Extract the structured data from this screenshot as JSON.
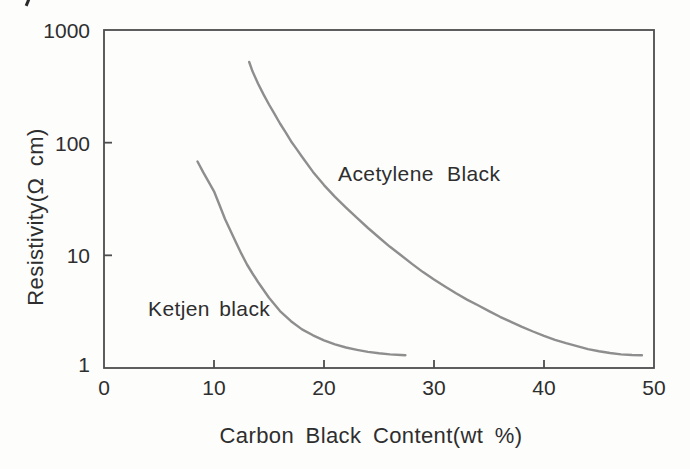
{
  "figure": {
    "background": "#fdfdfc",
    "axis_color": "#4d4d4d",
    "curve_color": "#8e8e8e",
    "text_color": "#2e2e2e"
  },
  "chart_data": {
    "type": "line",
    "title": "",
    "xlabel": "Carbon Black Content(wt %)",
    "ylabel": "Resistivity(Ω cm)",
    "x_ticks": [
      0,
      10,
      20,
      30,
      40,
      50
    ],
    "y_ticks": [
      1,
      10,
      100,
      1000
    ],
    "xlim": [
      0,
      50
    ],
    "ylim": [
      1,
      1000
    ],
    "y_scale": "log",
    "grid": false,
    "legend_position": "inline-labels",
    "series": [
      {
        "name": "Ketjen black",
        "points": [
          [
            8.5,
            68
          ],
          [
            9,
            55
          ],
          [
            9.5,
            45
          ],
          [
            10,
            37
          ],
          [
            10.5,
            28
          ],
          [
            11,
            21
          ],
          [
            11.5,
            16.5
          ],
          [
            12,
            13
          ],
          [
            12.5,
            10.3
          ],
          [
            13,
            8.3
          ],
          [
            13.5,
            6.9
          ],
          [
            14,
            5.8
          ],
          [
            15,
            4.2
          ],
          [
            16,
            3.2
          ],
          [
            17,
            2.6
          ],
          [
            18,
            2.2
          ],
          [
            19,
            1.95
          ],
          [
            20,
            1.76
          ],
          [
            21,
            1.62
          ],
          [
            22,
            1.52
          ],
          [
            23,
            1.45
          ],
          [
            24,
            1.39
          ],
          [
            25,
            1.35
          ],
          [
            26,
            1.32
          ],
          [
            27,
            1.305
          ],
          [
            27.4,
            1.3
          ]
        ]
      },
      {
        "name": "Acetylene Black",
        "points": [
          [
            13.2,
            520
          ],
          [
            13.5,
            430
          ],
          [
            14,
            335
          ],
          [
            14.5,
            268
          ],
          [
            15,
            218
          ],
          [
            15.5,
            180
          ],
          [
            16,
            148
          ],
          [
            16.5,
            124
          ],
          [
            17,
            103
          ],
          [
            17.5,
            88
          ],
          [
            18,
            75
          ],
          [
            19,
            55
          ],
          [
            20,
            42
          ],
          [
            21,
            33
          ],
          [
            22,
            26.5
          ],
          [
            23,
            21.5
          ],
          [
            24,
            17.5
          ],
          [
            25,
            14.4
          ],
          [
            26,
            11.9
          ],
          [
            27,
            10
          ],
          [
            28,
            8.4
          ],
          [
            29,
            7.1
          ],
          [
            30,
            6.1
          ],
          [
            31,
            5.3
          ],
          [
            32,
            4.6
          ],
          [
            33,
            4.05
          ],
          [
            34,
            3.6
          ],
          [
            35,
            3.2
          ],
          [
            36,
            2.85
          ],
          [
            37,
            2.57
          ],
          [
            38,
            2.32
          ],
          [
            39,
            2.11
          ],
          [
            40,
            1.93
          ],
          [
            41,
            1.78
          ],
          [
            42,
            1.66
          ],
          [
            43,
            1.56
          ],
          [
            44,
            1.47
          ],
          [
            45,
            1.41
          ],
          [
            46,
            1.36
          ],
          [
            47,
            1.32
          ],
          [
            48,
            1.305
          ],
          [
            48.9,
            1.3
          ]
        ]
      }
    ]
  }
}
